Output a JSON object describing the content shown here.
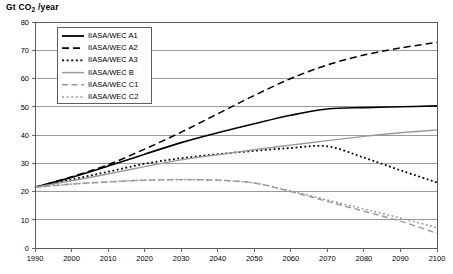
{
  "chart_data": {
    "type": "line",
    "title": "Gt CO2 /year",
    "title_prefix": "Gt CO",
    "title_sub": "2",
    "title_suffix": " /year",
    "xlabel": "",
    "ylabel": "Gt CO2 /year",
    "xlim": [
      1990,
      2100
    ],
    "ylim": [
      0,
      80
    ],
    "grid": true,
    "legend_position": "top-left-inside",
    "x": [
      1990,
      2000,
      2010,
      2020,
      2030,
      2040,
      2050,
      2060,
      2070,
      2080,
      2090,
      2100
    ],
    "xticklabels": [
      "1990",
      "2000",
      "2010",
      "2020",
      "2030",
      "2040",
      "2050",
      "2060",
      "2070",
      "2080",
      "2090",
      "2100"
    ],
    "yticks": [
      0,
      10,
      20,
      30,
      40,
      50,
      60,
      70,
      80
    ],
    "yticklabels": [
      "0",
      "10",
      "20",
      "30",
      "40",
      "50",
      "60",
      "70",
      "80"
    ],
    "series": [
      {
        "name": "IIASA/WEC A1",
        "color": "#000000",
        "dash": "none",
        "width": 1.6,
        "values": [
          21.5,
          25.0,
          29.0,
          33.2,
          37.3,
          40.8,
          44.0,
          47.0,
          49.2,
          49.7,
          50.0,
          50.3
        ]
      },
      {
        "name": "IIASA/WEC A2",
        "color": "#000000",
        "dash": "7,4",
        "width": 1.5,
        "values": [
          21.5,
          25.2,
          29.5,
          35.0,
          41.0,
          47.5,
          54.0,
          60.0,
          64.8,
          68.3,
          70.8,
          72.8
        ]
      },
      {
        "name": "IIASA/WEC A3",
        "color": "#000000",
        "dash": "1.8,2.6",
        "width": 1.8,
        "values": [
          21.5,
          24.2,
          27.0,
          29.8,
          31.8,
          33.2,
          34.4,
          35.4,
          36.0,
          32.0,
          27.5,
          23.2
        ]
      },
      {
        "name": "IIASA/WEC B",
        "color": "#9a9a9a",
        "dash": "none",
        "width": 1.4,
        "values": [
          21.5,
          23.8,
          26.2,
          28.8,
          31.2,
          33.0,
          34.8,
          36.4,
          38.0,
          39.5,
          40.8,
          41.8
        ]
      },
      {
        "name": "IIASA/WEC C1",
        "color": "#9a9a9a",
        "dash": "6,3.5",
        "width": 1.4,
        "values": [
          21.5,
          22.6,
          23.4,
          24.0,
          24.2,
          24.0,
          23.0,
          20.0,
          16.5,
          13.0,
          9.5,
          5.2
        ]
      },
      {
        "name": "IIASA/WEC C2",
        "color": "#9a9a9a",
        "dash": "1.8,2.6",
        "width": 1.6,
        "values": [
          21.5,
          22.6,
          23.4,
          24.0,
          24.2,
          24.0,
          23.0,
          20.2,
          17.0,
          13.8,
          10.6,
          7.2
        ]
      }
    ],
    "legend_entries": [
      {
        "label": "IIASA/WEC A1",
        "color": "#000000",
        "dash": "none",
        "width": 1.8
      },
      {
        "label": "IIASA/WEC A2",
        "color": "#000000",
        "dash": "7,4",
        "width": 1.8
      },
      {
        "label": "IIASA/WEC A3",
        "color": "#000000",
        "dash": "2,2.6",
        "width": 1.8
      },
      {
        "label": "IIASA/WEC B",
        "color": "#9a9a9a",
        "dash": "none",
        "width": 1.5
      },
      {
        "label": "IIASA/WEC C1",
        "color": "#9a9a9a",
        "dash": "6,3.5",
        "width": 1.5
      },
      {
        "label": "IIASA/WEC C2",
        "color": "#9a9a9a",
        "dash": "2,2.6",
        "width": 1.5
      }
    ]
  }
}
